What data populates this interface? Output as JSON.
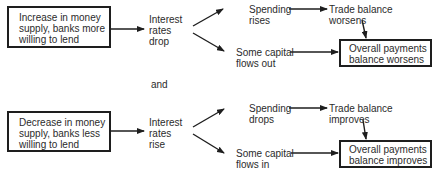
{
  "diagram": {
    "scenario_top": {
      "cause_box": "Increase in money\nsupply, banks more\nwilling to lend",
      "interest": "Interest\nrates\ndrop",
      "spending": "Spending\nrises",
      "trade": "Trade balance\nworsens",
      "capital": "Some capital\nflows out",
      "result_box": "Overall payments\nbalance worsens"
    },
    "connector": "and",
    "scenario_bottom": {
      "cause_box": "Decrease in money\nsupply, banks less\nwilling to lend",
      "interest": "Interest\nrates\nrise",
      "spending": "Spending\ndrops",
      "trade": "Trade balance\nimproves",
      "capital": "Some capital\nflows in",
      "result_box": "Overall payments\nbalance improves"
    },
    "colors": {
      "line": "#1e1e1e",
      "text": "#2b2b2b",
      "background": "#ffffff"
    }
  }
}
